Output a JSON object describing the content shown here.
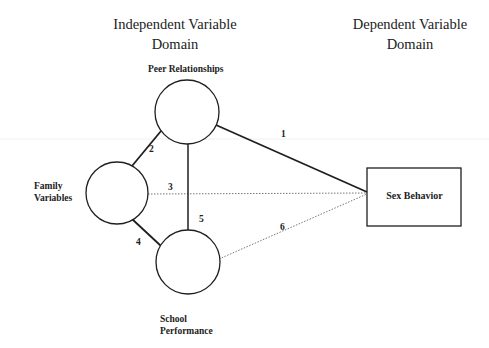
{
  "headings": {
    "independent": {
      "line1": "Independent Variable",
      "line2": "Domain"
    },
    "dependent": {
      "line1": "Dependent Variable",
      "line2": "Domain"
    }
  },
  "nodes": {
    "peer": {
      "label": "Peer Relationships",
      "shape": "circle"
    },
    "family": {
      "line1": "Family",
      "line2": "Variables",
      "shape": "circle"
    },
    "school": {
      "line1": "School",
      "line2": "Performance",
      "shape": "circle"
    },
    "sex": {
      "label": "Sex Behavior",
      "shape": "rectangle"
    }
  },
  "edges": [
    {
      "id": "1",
      "from": "Peer Relationships",
      "to": "Sex Behavior",
      "style": "solid"
    },
    {
      "id": "2",
      "from": "Family Variables",
      "to": "Peer Relationships",
      "style": "solid"
    },
    {
      "id": "3",
      "from": "Family Variables",
      "to": "Sex Behavior",
      "style": "dotted"
    },
    {
      "id": "4",
      "from": "Family Variables",
      "to": "School Performance",
      "style": "solid"
    },
    {
      "id": "5",
      "from": "Peer Relationships",
      "to": "School Performance",
      "style": "solid"
    },
    {
      "id": "6",
      "from": "School Performance",
      "to": "Sex Behavior",
      "style": "dotted"
    }
  ],
  "colors": {
    "stroke": "#1f1f1f",
    "dotted": "#777777",
    "background": "#ffffff"
  }
}
